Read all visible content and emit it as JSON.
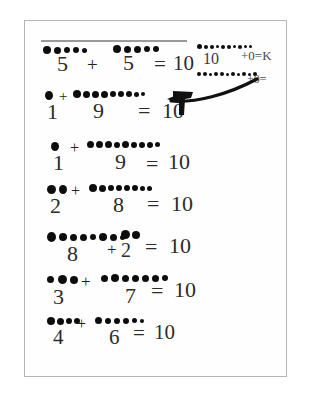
{
  "worksheet": {
    "title": "Handwritten number bonds to 10 worksheet",
    "paper_color": "#fefefe",
    "ink_color": "#0d0d0d",
    "pencil_color": "#2b2b2b",
    "rule_color": "#9a9a9a",
    "equations": [
      {
        "id": "eq-1",
        "left_addend": "5",
        "plus": "+",
        "right_addend": "5",
        "equals": "=",
        "sum": "10",
        "left_dot_count": 5,
        "right_dot_count": 5,
        "has_rule_above": true
      },
      {
        "id": "eq-2",
        "left_addend": "1",
        "plus": "+",
        "right_addend": "9",
        "equals": "=",
        "sum": "10",
        "left_dot_count": 1,
        "right_dot_count": 9,
        "has_rule_above": false
      },
      {
        "id": "eq-3",
        "left_addend": "1",
        "plus": "+",
        "right_addend": "9",
        "equals": "=",
        "sum": "10",
        "left_dot_count": 1,
        "right_dot_count": 9,
        "has_rule_above": false
      },
      {
        "id": "eq-4",
        "left_addend": "2",
        "plus": "+",
        "right_addend": "8",
        "equals": "=",
        "sum": "10",
        "left_dot_count": 2,
        "right_dot_count": 8,
        "has_rule_above": false
      },
      {
        "id": "eq-5",
        "left_addend": "8",
        "plus": "+",
        "right_addend": "2",
        "equals": "=",
        "sum": "10",
        "left_dot_count": 8,
        "right_dot_count": 2,
        "has_rule_above": false
      },
      {
        "id": "eq-6",
        "left_addend": "3",
        "plus": "+",
        "right_addend": "7",
        "equals": "=",
        "sum": "10",
        "left_dot_count": 3,
        "right_dot_count": 7,
        "has_rule_above": false
      },
      {
        "id": "eq-7",
        "left_addend": "4",
        "plus": "+",
        "right_addend": "6",
        "equals": "=",
        "sum": "10",
        "left_dot_count": 4,
        "right_dot_count": 6,
        "has_rule_above": false
      }
    ],
    "annotations": [
      {
        "id": "annotation-top",
        "sum_mark": "10",
        "trailing_text": "+0=K",
        "dot_count": 10
      },
      {
        "id": "annotation-second",
        "trailing_text": "+0=",
        "dot_count": 11
      }
    ]
  }
}
